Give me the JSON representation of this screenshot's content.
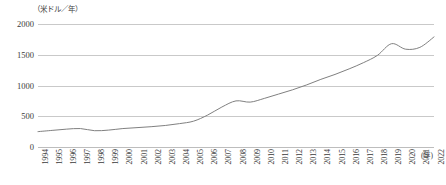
{
  "chart_data": {
    "type": "line",
    "title": "",
    "subtitle": "",
    "xlabel": "(年)",
    "ylabel": "（米ドル／年）",
    "ylim": [
      0,
      2000
    ],
    "yticks": [
      0,
      500,
      1000,
      1500,
      2000
    ],
    "ytick_labels": [
      "0",
      "500",
      "1000",
      "1500",
      "2000"
    ],
    "grid": true,
    "legend": false,
    "legend_position": "none",
    "line_color": "#808080",
    "grid_color": "#c9c9c9",
    "categories": [
      "1994",
      "1995",
      "1996",
      "1997",
      "1998",
      "1999",
      "2000",
      "2001",
      "2002",
      "2003",
      "2004",
      "2005",
      "2006",
      "2007",
      "2008",
      "2009",
      "2010",
      "2011",
      "2012",
      "2013",
      "2014",
      "2015",
      "2016",
      "2017",
      "2018",
      "2019",
      "2020",
      "2021",
      "2022"
    ],
    "values": [
      250,
      270,
      290,
      300,
      265,
      275,
      300,
      315,
      330,
      350,
      380,
      420,
      520,
      650,
      750,
      730,
      790,
      860,
      930,
      1010,
      1100,
      1180,
      1270,
      1370,
      1490,
      1680,
      1590,
      1620,
      1790
    ]
  }
}
